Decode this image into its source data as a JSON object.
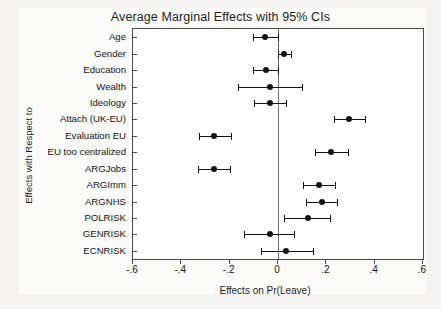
{
  "chart_data": {
    "type": "scatter",
    "title": "Average Marginal Effects with 95% CIs",
    "xlabel": "Effects on Pr(Leave)",
    "ylabel": "Effects with Respect to",
    "xlim": [
      -0.6,
      0.6
    ],
    "grid": false,
    "legend": null,
    "orientation": "horizontal",
    "reference_line": 0,
    "xticks": [
      -0.6,
      -0.4,
      -0.2,
      0,
      0.2,
      0.4,
      0.6
    ],
    "xticklabels": [
      "-.6",
      "-.4",
      "-.2",
      "0",
      ".2",
      ".4",
      ".6"
    ],
    "categories": [
      "Age",
      "Gender",
      "Education",
      "Wealth",
      "Ideology",
      "Attach (UK-EU)",
      "Evaluation EU",
      "EU too centralized",
      "ARGJobs",
      "ARGImm",
      "ARGNHS",
      "POLRISK",
      "GENRISK",
      "ECNRISK"
    ],
    "points": [
      {
        "label": "Age",
        "estimate": -0.055,
        "ci_low": -0.105,
        "ci_high": 0.0
      },
      {
        "label": "Gender",
        "estimate": 0.025,
        "ci_low": 0.0,
        "ci_high": 0.055
      },
      {
        "label": "Education",
        "estimate": -0.05,
        "ci_low": -0.105,
        "ci_high": 0.0
      },
      {
        "label": "Wealth",
        "estimate": -0.035,
        "ci_low": -0.165,
        "ci_high": 0.1
      },
      {
        "label": "Ideology",
        "estimate": -0.035,
        "ci_low": -0.1,
        "ci_high": 0.035
      },
      {
        "label": "Attach (UK-EU)",
        "estimate": 0.295,
        "ci_low": 0.23,
        "ci_high": 0.36
      },
      {
        "label": "Evaluation EU",
        "estimate": -0.265,
        "ci_low": -0.325,
        "ci_high": -0.195
      },
      {
        "label": "EU too centralized",
        "estimate": 0.22,
        "ci_low": 0.155,
        "ci_high": 0.29
      },
      {
        "label": "ARGJobs",
        "estimate": -0.265,
        "ci_low": -0.33,
        "ci_high": -0.2
      },
      {
        "label": "ARGImm",
        "estimate": 0.17,
        "ci_low": 0.105,
        "ci_high": 0.235
      },
      {
        "label": "ARGNHS",
        "estimate": 0.18,
        "ci_low": 0.115,
        "ci_high": 0.245
      },
      {
        "label": "POLRISK",
        "estimate": 0.125,
        "ci_low": 0.025,
        "ci_high": 0.215
      },
      {
        "label": "GENRISK",
        "estimate": -0.035,
        "ci_low": -0.14,
        "ci_high": 0.065
      },
      {
        "label": "ECNRISK",
        "estimate": 0.035,
        "ci_low": -0.07,
        "ci_high": 0.145
      }
    ],
    "marker_color": "#111111",
    "line_color": "#111111",
    "axis_color": "#4a4a4a"
  }
}
